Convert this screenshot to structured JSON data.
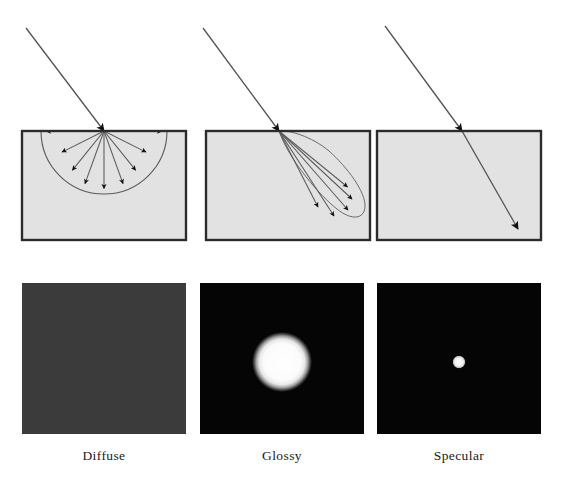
{
  "figure": {
    "background_color": "#ffffff",
    "columns": [
      {
        "id": "diffuse",
        "caption": "Diffuse",
        "diagram": {
          "surface_fill": "#e2e2e2",
          "surface_stroke": "#2b2b2b",
          "surface_rect": {
            "x": 22,
            "y": 131,
            "width": 164,
            "height": 109
          },
          "incident_ray": {
            "x1": 26,
            "y1": 28,
            "x2": 104,
            "y2": 131,
            "color": "#4a4a4a"
          },
          "hit_point": {
            "x": 104,
            "y": 131
          },
          "lobe_type": "hemisphere",
          "lobe_radius": 63,
          "ray_count": 9,
          "ray_angles_deg": [
            0,
            22.5,
            45,
            67.5,
            90,
            112.5,
            135,
            157.5,
            180
          ],
          "outline_color": "#4a4a4a",
          "arrow_color": "#111111"
        },
        "render": {
          "panel_rect": {
            "x": 22,
            "y": 283,
            "width": 164,
            "height": 151
          },
          "background_color": "#3b3b3b",
          "highlight": "none",
          "description": "uniform dark gray, no specular highlight"
        }
      },
      {
        "id": "glossy",
        "caption": "Glossy",
        "diagram": {
          "surface_fill": "#e2e2e2",
          "surface_stroke": "#2b2b2b",
          "surface_rect": {
            "x": 206,
            "y": 131,
            "width": 164,
            "height": 109
          },
          "incident_ray": {
            "x1": 203,
            "y1": 28,
            "x2": 279,
            "y2": 131,
            "color": "#4a4a4a"
          },
          "hit_point": {
            "x": 279,
            "y": 131
          },
          "lobe_type": "teardrop",
          "ray_count": 5,
          "ray_spread_deg": 26,
          "lobe_center_angle_deg": 52,
          "lobe_length": 98,
          "outline_color": "#4a4a4a",
          "arrow_color": "#111111"
        },
        "render": {
          "panel_rect": {
            "x": 200,
            "y": 283,
            "width": 164,
            "height": 151
          },
          "background_color": "#050505",
          "highlight": "soft-circle",
          "highlight_center": {
            "x": 282,
            "y": 362
          },
          "highlight_radius": 23,
          "highlight_color": "#f2f2f2",
          "description": "black panel with a large soft-edged white highlight"
        }
      },
      {
        "id": "specular",
        "caption": "Specular",
        "diagram": {
          "surface_fill": "#e2e2e2",
          "surface_stroke": "#2b2b2b",
          "surface_rect": {
            "x": 377,
            "y": 131,
            "width": 164,
            "height": 109
          },
          "incident_ray": {
            "x1": 385,
            "y1": 26,
            "x2": 462,
            "y2": 131,
            "color": "#4a4a4a"
          },
          "hit_point": {
            "x": 462,
            "y": 131
          },
          "lobe_type": "single-ray",
          "ray_count": 1,
          "outgoing_ray": {
            "x1": 462,
            "y1": 131,
            "x2": 518,
            "y2": 229
          },
          "outline_color": "#4a4a4a",
          "arrow_color": "#111111"
        },
        "render": {
          "panel_rect": {
            "x": 377,
            "y": 283,
            "width": 164,
            "height": 151
          },
          "background_color": "#050505",
          "highlight": "sharp-dot",
          "highlight_center": {
            "x": 459,
            "y": 362
          },
          "highlight_radius": 6,
          "highlight_color": "#ededed",
          "description": "black panel with a single small sharp white dot"
        }
      }
    ]
  }
}
